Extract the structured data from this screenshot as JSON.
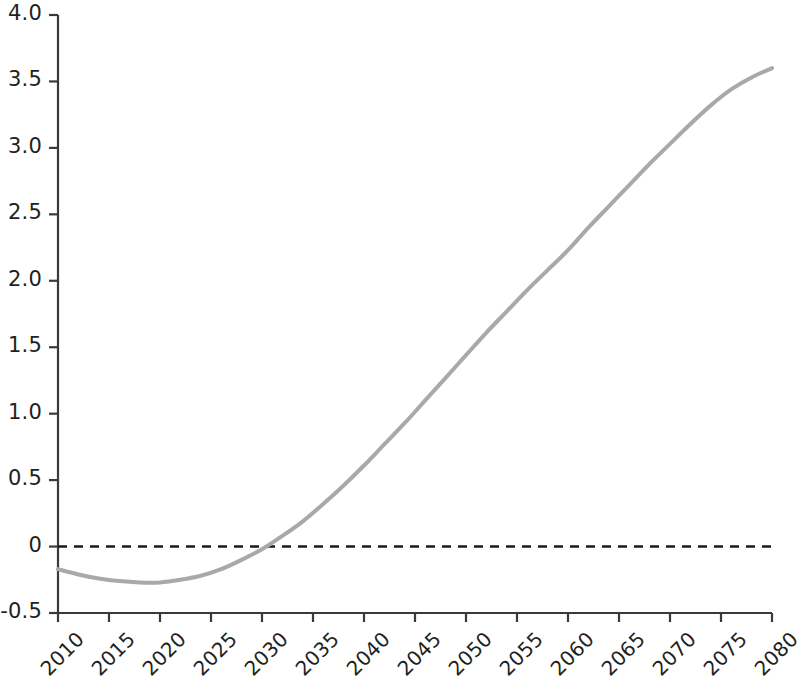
{
  "chart_data": {
    "type": "line",
    "title": "",
    "subtitle": "",
    "xlabel": "",
    "ylabel": "",
    "xlim": [
      2010,
      2080
    ],
    "ylim": [
      -0.5,
      4.0
    ],
    "grid": false,
    "legend": null,
    "y_ticks": [
      "4.0",
      "3.5",
      "3.0",
      "2.5",
      "2.0",
      "1.5",
      "1.0",
      "0.5",
      "0",
      "-0.5"
    ],
    "y_tick_values": [
      4.0,
      3.5,
      3.0,
      2.5,
      2.0,
      1.5,
      1.0,
      0.5,
      0,
      -0.5
    ],
    "x_ticks": [
      "2010",
      "2015",
      "2020",
      "2025",
      "2030",
      "2035",
      "2040",
      "2045",
      "2050",
      "2055",
      "2060",
      "2065",
      "2070",
      "2075",
      "2080"
    ],
    "x_tick_values": [
      2010,
      2015,
      2020,
      2025,
      2030,
      2035,
      2040,
      2045,
      2050,
      2055,
      2060,
      2065,
      2070,
      2075,
      2080
    ],
    "annotations": [
      {
        "name": "zero-reference-line",
        "type": "hline",
        "y": 0,
        "style": "dashed",
        "color": "#1a1a1a"
      }
    ],
    "series": [
      {
        "name": "projection",
        "color": "#a9a9a9",
        "line_width": 4,
        "style": "solid",
        "x": [
          2010,
          2012,
          2014,
          2016,
          2018,
          2020,
          2022,
          2024,
          2026,
          2028,
          2030,
          2032,
          2034,
          2036,
          2038,
          2040,
          2042,
          2044,
          2046,
          2048,
          2050,
          2052,
          2054,
          2056,
          2058,
          2060,
          2062,
          2064,
          2066,
          2068,
          2070,
          2072,
          2074,
          2076,
          2078,
          2080
        ],
        "values": [
          -0.17,
          -0.21,
          -0.24,
          -0.26,
          -0.27,
          -0.27,
          -0.25,
          -0.22,
          -0.17,
          -0.1,
          -0.02,
          0.08,
          0.19,
          0.32,
          0.46,
          0.61,
          0.77,
          0.93,
          1.1,
          1.27,
          1.44,
          1.61,
          1.77,
          1.93,
          2.08,
          2.23,
          2.4,
          2.56,
          2.72,
          2.88,
          3.03,
          3.18,
          3.32,
          3.44,
          3.53,
          3.6
        ]
      }
    ]
  },
  "plot_geometry": {
    "left": 58,
    "right": 772,
    "top": 15,
    "bottom": 613,
    "zero_y": 548
  },
  "colors": {
    "series": "#a9a9a9",
    "axis": "#3a3a3a",
    "text": "#231f20",
    "background": "#ffffff",
    "zero_line": "#1a1a1a"
  }
}
